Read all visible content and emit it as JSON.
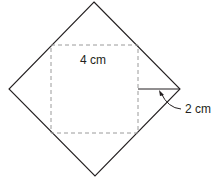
{
  "diagram": {
    "inner_square_label": "4 cm",
    "corner_distance_label": "2 cm",
    "colors": {
      "stroke": "#231f20",
      "dashed": "#9a9a9a",
      "background": "#ffffff"
    }
  }
}
